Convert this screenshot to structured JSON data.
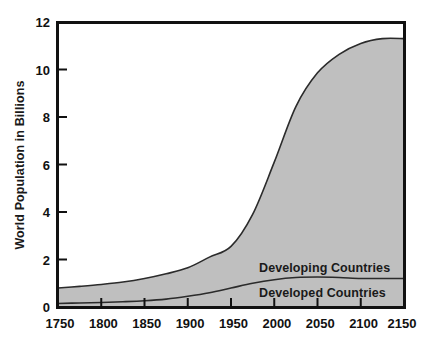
{
  "chart_data": {
    "type": "area",
    "title": "",
    "subtitle": "",
    "xlabel": "",
    "ylabel": "World Population in Billions",
    "xlim": [
      1750,
      2150
    ],
    "ylim": [
      0,
      12
    ],
    "grid": false,
    "stacked": true,
    "legend_position": "inline-annotation",
    "xticks": [
      1750,
      1800,
      1850,
      1900,
      1950,
      2000,
      2050,
      2100,
      2150
    ],
    "xtick_labels": [
      "1750",
      "1800",
      "1850",
      "1900",
      "1950",
      "2000",
      "2050",
      "2100",
      "2150"
    ],
    "yticks": [
      0,
      2,
      4,
      6,
      8,
      10,
      12
    ],
    "ytick_labels": [
      "0",
      "2",
      "4",
      "6",
      "8",
      "10",
      "12"
    ],
    "x": [
      1750,
      1775,
      1800,
      1825,
      1850,
      1875,
      1900,
      1925,
      1950,
      1975,
      2000,
      2025,
      2050,
      2075,
      2100,
      2125,
      2150
    ],
    "series": [
      {
        "name": "Developed Countries",
        "label": "Developed Countries",
        "values": [
          0.15,
          0.17,
          0.19,
          0.22,
          0.26,
          0.33,
          0.45,
          0.6,
          0.8,
          1.0,
          1.15,
          1.24,
          1.26,
          1.24,
          1.2,
          1.2,
          1.2
        ],
        "color": "#bfbfbf",
        "line_color": "#2b2b2b"
      },
      {
        "name": "Developing Countries",
        "label": "Developing Countries",
        "values": [
          0.65,
          0.7,
          0.76,
          0.83,
          0.94,
          1.07,
          1.2,
          1.5,
          1.75,
          2.9,
          4.95,
          7.2,
          8.6,
          9.4,
          9.9,
          10.1,
          10.1
        ],
        "color": "#bfbfbf",
        "line_color": "#2b2b2b"
      }
    ],
    "totals": [
      0.8,
      0.87,
      0.95,
      1.05,
      1.2,
      1.4,
      1.65,
      2.1,
      2.55,
      3.9,
      6.1,
      8.44,
      9.86,
      10.64,
      11.1,
      11.3,
      11.3
    ],
    "annotations": [
      {
        "text": "Developing Countries",
        "x": 2010,
        "y": 1.75
      },
      {
        "text": "Developed Countries",
        "x": 2010,
        "y": 0.72
      }
    ],
    "colors": {
      "fill": "#bfbfbf",
      "line": "#2b2b2b",
      "axis": "#111111",
      "background": "#ffffff",
      "text": "#111111"
    }
  },
  "axis": {
    "y_title": "World Population in Billions"
  },
  "labels": {
    "developing": "Developing Countries",
    "developed": "Developed Countries"
  },
  "xticks": {
    "t0": "1750",
    "t1": "1800",
    "t2": "1850",
    "t3": "1900",
    "t4": "1950",
    "t5": "2000",
    "t6": "2050",
    "t7": "2100",
    "t8": "2150"
  },
  "yticks": {
    "t0": "0",
    "t1": "2",
    "t2": "4",
    "t3": "6",
    "t4": "8",
    "t5": "10",
    "t6": "12"
  }
}
